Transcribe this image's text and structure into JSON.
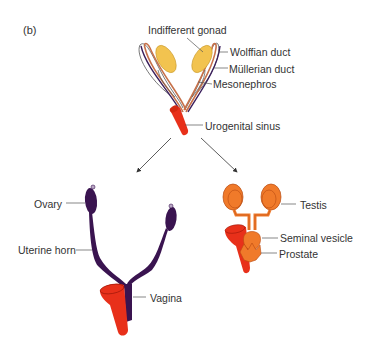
{
  "panel_label": "(b)",
  "colors": {
    "gonad": "#f2c34f",
    "gonad_outline": "#a87a1a",
    "wolffian": "#c7714a",
    "mullerian": "#3b1f5c",
    "mesonephros": "#444444",
    "urogenital_sinus": "#e8301a",
    "female_tract": "#3a1450",
    "male_tract": "#f07a2a",
    "male_outline": "#b84a10",
    "leader": "#555555"
  },
  "indifferent_stage": {
    "labels": {
      "indifferent_gonad": "Indifferent gonad",
      "wolffian_duct": "Wolffian duct",
      "mullerian_duct": "Müllerian duct",
      "mesonephros": "Mesonephros",
      "urogenital_sinus": "Urogenital sinus"
    }
  },
  "female": {
    "labels": {
      "ovary": "Ovary",
      "uterine_horn": "Uterine horn",
      "vagina": "Vagina"
    }
  },
  "male": {
    "labels": {
      "testis": "Testis",
      "seminal_vesicle": "Seminal vesicle",
      "prostate": "Prostate"
    }
  }
}
